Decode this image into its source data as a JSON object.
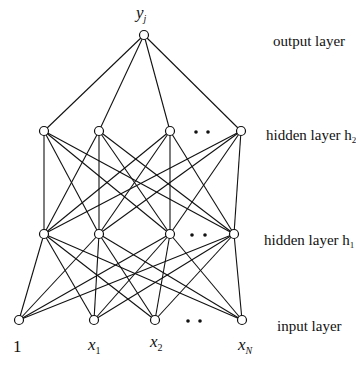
{
  "diagram": {
    "layers": [
      {
        "name": "output layer",
        "label_main": "output layer",
        "label_sub": "",
        "y": 35,
        "nodes": [
          {
            "x": 144,
            "label": "y",
            "sub": "j"
          }
        ],
        "dots": []
      },
      {
        "name": "hidden layer h2",
        "label_main": "hidden layer h",
        "label_sub": "2",
        "y": 131,
        "nodes": [
          {
            "x": 44
          },
          {
            "x": 99
          },
          {
            "x": 170
          },
          {
            "x": 241
          }
        ],
        "dots": [
          196,
          208
        ]
      },
      {
        "name": "hidden layer h1",
        "label_main": "hidden layer h",
        "label_sub": "1",
        "y": 234,
        "nodes": [
          {
            "x": 44
          },
          {
            "x": 99
          },
          {
            "x": 170
          },
          {
            "x": 234
          }
        ],
        "dots": [
          192,
          205
        ]
      },
      {
        "name": "input layer",
        "label_main": "input layer",
        "label_sub": "",
        "y": 320,
        "nodes": [
          {
            "x": 19,
            "label": "1",
            "sub": ""
          },
          {
            "x": 94,
            "label": "x",
            "sub": "1"
          },
          {
            "x": 155,
            "label": "x",
            "sub": "2"
          },
          {
            "x": 242,
            "label": "x",
            "sub": "N"
          }
        ],
        "dots": [
          188,
          200
        ]
      }
    ],
    "labels": {
      "output": "output layer",
      "hidden2": "hidden layer h",
      "hidden2_sub": "2",
      "hidden1": "hidden layer h",
      "hidden1_sub": "1",
      "input": "input layer",
      "y_out": "y",
      "y_out_sub": "j",
      "bias": "1",
      "x1": "x",
      "x1_sub": "1",
      "x2": "x",
      "x2_sub": "2",
      "xN": "x",
      "xN_sub": "N"
    },
    "colors": {
      "stroke": "#111111",
      "background": "#ffffff"
    }
  }
}
